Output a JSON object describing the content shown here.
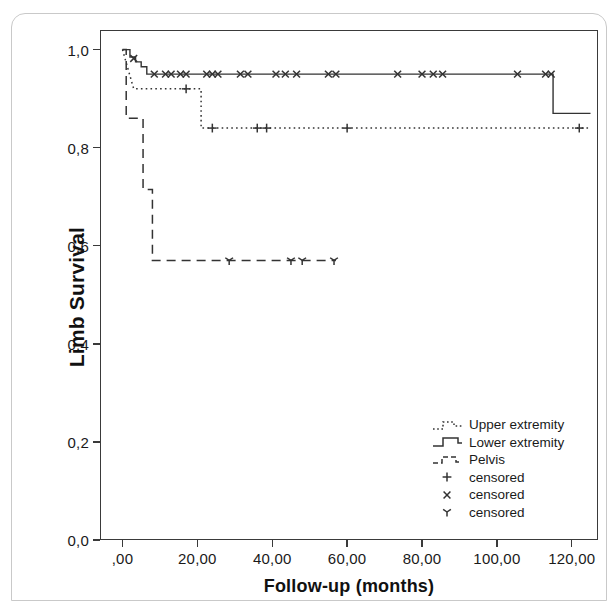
{
  "chart_data": {
    "type": "line",
    "subtype": "kaplan-meier-step",
    "title": "",
    "xlabel": "Follow-up (months)",
    "ylabel": "Limb Survival",
    "xlim": [
      -6,
      127
    ],
    "ylim": [
      0.0,
      1.04
    ],
    "grid": false,
    "legend_position": "inside-bottom-right",
    "x_tick_labels": [
      ",00",
      "20,00",
      "40,00",
      "60,00",
      "80,00",
      "100,00",
      "120,00"
    ],
    "x_tick_values": [
      0,
      20,
      40,
      60,
      80,
      100,
      120
    ],
    "y_tick_labels": [
      "0,0",
      "0,2",
      "0,4",
      "0,6",
      "0,8",
      "1,0"
    ],
    "y_tick_values": [
      0.0,
      0.2,
      0.4,
      0.6,
      0.8,
      1.0
    ],
    "series": [
      {
        "name": "Upper extremity",
        "linestyle": "dotted",
        "color": "#333333",
        "marker": "plus",
        "steps": [
          [
            0.0,
            1.0
          ],
          [
            1.5,
            0.96
          ],
          [
            3.0,
            0.92
          ],
          [
            21.0,
            0.92
          ],
          [
            21.0,
            0.84
          ],
          [
            125.0,
            0.84
          ]
        ],
        "censored_points": [
          [
            17.0,
            0.92
          ],
          [
            24.0,
            0.84
          ],
          [
            36.0,
            0.84
          ],
          [
            38.5,
            0.84
          ],
          [
            60.0,
            0.84
          ],
          [
            122.0,
            0.84
          ]
        ]
      },
      {
        "name": "Lower extremity",
        "linestyle": "solid",
        "color": "#333333",
        "marker": "cross",
        "steps": [
          [
            0.0,
            1.0
          ],
          [
            2.0,
            1.0
          ],
          [
            2.0,
            0.985
          ],
          [
            3.5,
            0.985
          ],
          [
            3.5,
            0.975
          ],
          [
            5.0,
            0.975
          ],
          [
            5.0,
            0.965
          ],
          [
            6.5,
            0.965
          ],
          [
            6.5,
            0.95
          ],
          [
            115.0,
            0.95
          ],
          [
            115.0,
            0.87
          ],
          [
            125.0,
            0.87
          ]
        ],
        "censored_points": [
          [
            3.0,
            0.982
          ],
          [
            8.5,
            0.95
          ],
          [
            11.5,
            0.95
          ],
          [
            13.0,
            0.95
          ],
          [
            15.5,
            0.95
          ],
          [
            17.0,
            0.95
          ],
          [
            22.5,
            0.95
          ],
          [
            24.0,
            0.95
          ],
          [
            25.5,
            0.95
          ],
          [
            31.5,
            0.95
          ],
          [
            33.5,
            0.95
          ],
          [
            41.0,
            0.95
          ],
          [
            43.5,
            0.95
          ],
          [
            46.5,
            0.95
          ],
          [
            55.0,
            0.95
          ],
          [
            57.0,
            0.95
          ],
          [
            73.5,
            0.95
          ],
          [
            80.0,
            0.95
          ],
          [
            83.0,
            0.95
          ],
          [
            85.5,
            0.95
          ],
          [
            105.5,
            0.95
          ],
          [
            113.0,
            0.95
          ],
          [
            114.5,
            0.95
          ]
        ]
      },
      {
        "name": "Pelvis",
        "linestyle": "dashed",
        "color": "#333333",
        "marker": "tri",
        "steps": [
          [
            0.0,
            1.0
          ],
          [
            1.0,
            1.0
          ],
          [
            1.0,
            0.86
          ],
          [
            5.5,
            0.86
          ],
          [
            5.5,
            0.715
          ],
          [
            8.0,
            0.715
          ],
          [
            8.0,
            0.57
          ],
          [
            57.0,
            0.57
          ]
        ],
        "censored_points": [
          [
            28.5,
            0.57
          ],
          [
            45.0,
            0.57
          ],
          [
            48.0,
            0.57
          ],
          [
            56.5,
            0.57
          ]
        ]
      }
    ],
    "legend_entries": [
      {
        "label": "Upper extremity",
        "key": "dotted-step"
      },
      {
        "label": "Lower extremity",
        "key": "solid-step"
      },
      {
        "label": "Pelvis",
        "key": "dashed-step"
      },
      {
        "label": "censored",
        "key": "plus-marker"
      },
      {
        "label": "censored",
        "key": "cross-marker"
      },
      {
        "label": "censored",
        "key": "tri-marker"
      }
    ]
  }
}
